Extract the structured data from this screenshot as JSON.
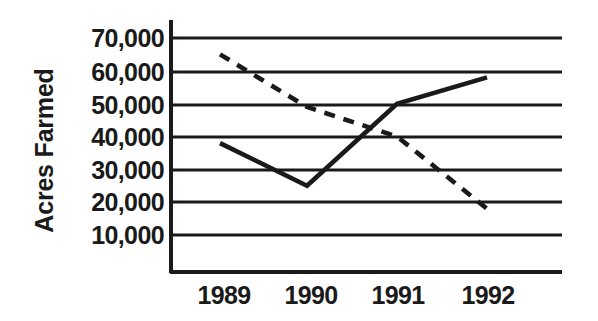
{
  "chart_data": {
    "type": "line",
    "title": "",
    "subtitle": "",
    "xlabel": "",
    "ylabel": "Acres Farmed",
    "categories": [
      "1989",
      "1990",
      "1991",
      "1992"
    ],
    "x_tick_labels": [
      "1989",
      "1990",
      "1991",
      "1992"
    ],
    "y_tick_labels": [
      "10,000",
      "20,000",
      "30,000",
      "40,000",
      "50,000",
      "60,000",
      "70,000"
    ],
    "y_tick_values": [
      10000,
      20000,
      30000,
      40000,
      50000,
      60000,
      70000
    ],
    "ylim": [
      0,
      75000
    ],
    "grid": "horizontal",
    "legend": "none",
    "series": [
      {
        "name": "solid-series",
        "style": "solid",
        "color": "#1a1a1a",
        "values": [
          38000,
          25000,
          50000,
          58000
        ]
      },
      {
        "name": "dashed-series",
        "style": "dashed",
        "color": "#1a1a1a",
        "values": [
          65000,
          49000,
          40000,
          18000
        ]
      }
    ],
    "annotations": []
  },
  "axes": {
    "y_axis_title": "Acres Farmed",
    "ticks": [
      {
        "label": "70,000",
        "value": 70000
      },
      {
        "label": "60,000",
        "value": 60000
      },
      {
        "label": "50,000",
        "value": 50000
      },
      {
        "label": "40,000",
        "value": 40000
      },
      {
        "label": "30,000",
        "value": 30000
      },
      {
        "label": "20,000",
        "value": 20000
      },
      {
        "label": "10,000",
        "value": 10000
      }
    ],
    "x_ticks": [
      {
        "label": "1989"
      },
      {
        "label": "1990"
      },
      {
        "label": "1991"
      },
      {
        "label": "1992"
      }
    ]
  }
}
